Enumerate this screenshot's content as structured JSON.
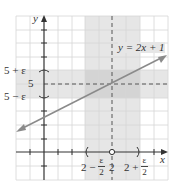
{
  "diagram": {
    "type": "epsilon-delta limit illustration",
    "function_label": "y = 2x + 1",
    "axes": {
      "x_label": "x",
      "y_label": "y"
    },
    "y_ticks": [
      {
        "label": "5 + ε",
        "value": "5+epsilon"
      },
      {
        "label": "5",
        "value": 5
      },
      {
        "label": "5 − ε",
        "value": "5-epsilon"
      }
    ],
    "x_ticks": [
      {
        "prefix": "2 −",
        "frac_num": "ε",
        "frac_den": "2",
        "value": "2-epsilon/2"
      },
      {
        "label": "2",
        "value": 2
      },
      {
        "prefix": "2 +",
        "frac_num": "ε",
        "frac_den": "2",
        "value": "2+epsilon/2"
      }
    ],
    "point": {
      "x": 2,
      "y": 5,
      "style": "open circle on x-axis at x=2"
    },
    "bands": {
      "vertical": "2 − ε/2 < x < 2 + ε/2",
      "horizontal": "5 − ε < y < 5 + ε"
    },
    "colors": {
      "grid": "#d6d6d6",
      "band": "#e6e6e6",
      "band_overlap": "#d4d4d4",
      "line": "#8a8a8a",
      "axis": "#333333"
    }
  }
}
